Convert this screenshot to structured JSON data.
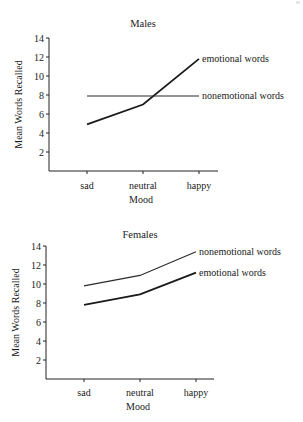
{
  "chart_data": [
    {
      "type": "line",
      "title": "Males",
      "xlabel": "Mood",
      "ylabel": "Mean Words Recalled",
      "categories": [
        "sad",
        "neutral",
        "happy"
      ],
      "ylim": [
        0,
        14
      ],
      "yticks": [
        2,
        4,
        6,
        8,
        10,
        12,
        14
      ],
      "grid": false,
      "legend_position": "inline-right-of-line-end",
      "series": [
        {
          "name": "emotional words",
          "values": [
            4.9,
            7.0,
            11.8
          ]
        },
        {
          "name": "nonemotional words",
          "values": [
            7.9,
            7.9,
            7.9
          ]
        }
      ]
    },
    {
      "type": "line",
      "title": "Females",
      "xlabel": "Mood",
      "ylabel": "Mean Words Recalled",
      "categories": [
        "sad",
        "neutral",
        "happy"
      ],
      "ylim": [
        0,
        14
      ],
      "yticks": [
        2,
        4,
        6,
        8,
        10,
        12,
        14
      ],
      "grid": false,
      "legend_position": "inline-right-of-line-end",
      "series": [
        {
          "name": "nonemotional words",
          "values": [
            9.8,
            10.9,
            13.4
          ]
        },
        {
          "name": "emotional words",
          "values": [
            7.8,
            8.9,
            11.2
          ]
        }
      ]
    }
  ]
}
